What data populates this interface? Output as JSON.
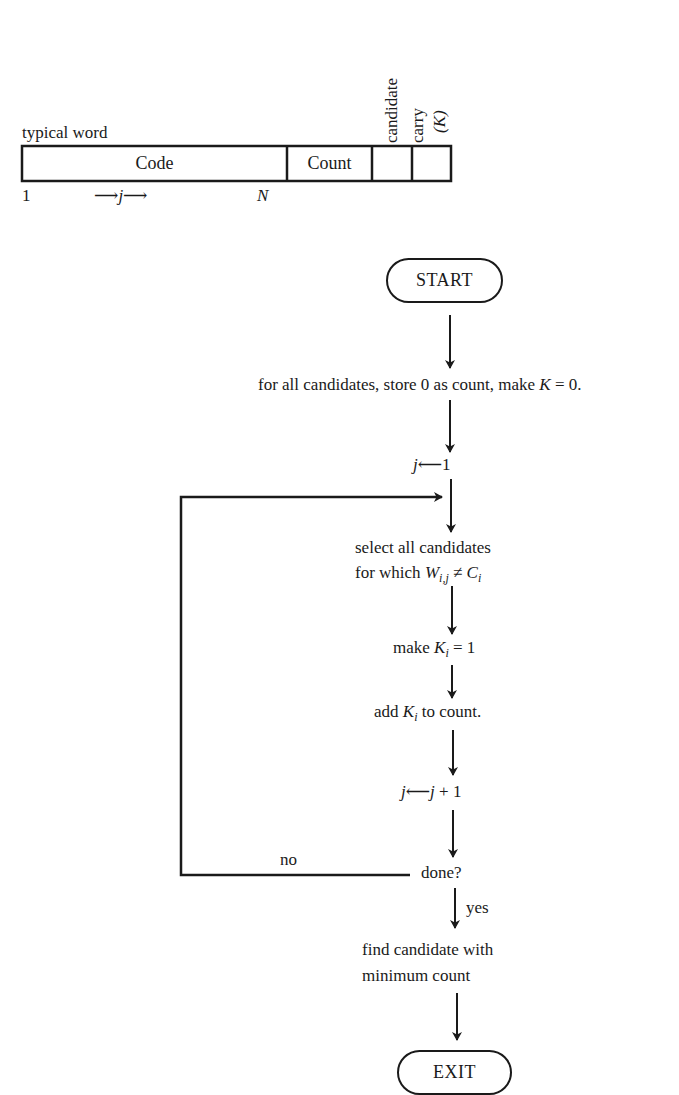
{
  "word_layout": {
    "title": "typical word",
    "fields": [
      {
        "label": "Code"
      },
      {
        "label": "Count"
      },
      {
        "label": ""
      },
      {
        "label": ""
      }
    ],
    "column_headers": {
      "candidate": "candidate",
      "carry": "carry",
      "carry_symbol": "(K)"
    },
    "index_start": "1",
    "index_arrow_left": "⟶",
    "index_var": "j",
    "index_arrow_right": "⟶",
    "index_end": "N"
  },
  "flowchart": {
    "start": "START",
    "step_init": {
      "text": "for all candidates, store 0 as count, make ",
      "var": "K",
      "rest": " = 0."
    },
    "step_j_init": {
      "lhs": "j",
      "arrow": "⟵",
      "rhs": "1"
    },
    "step_select": {
      "line1": "select all candidates",
      "line2_prefix": "for which ",
      "w": "W",
      "w_sub": "i,j",
      "neq": " ≠ ",
      "c": "C",
      "c_sub": "i"
    },
    "step_make_k": {
      "prefix": "make ",
      "var": "K",
      "sub": "i",
      "rest": " = 1"
    },
    "step_add_k": {
      "prefix": "add ",
      "var": "K",
      "sub": "i",
      "rest": " to count."
    },
    "step_j_inc": {
      "lhs": "j",
      "arrow": "⟵",
      "rhs_var": "j",
      "rhs_rest": " + 1"
    },
    "decision": "done?",
    "no_label": "no",
    "yes_label": "yes",
    "step_find": {
      "line1": "find candidate with",
      "line2": "minimum count"
    },
    "exit": "EXIT"
  }
}
